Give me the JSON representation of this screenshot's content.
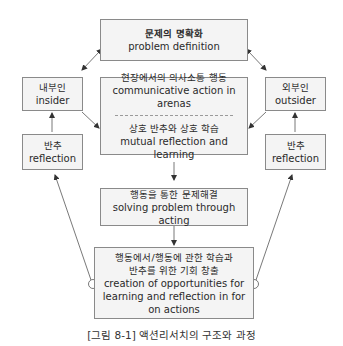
{
  "nodes": {
    "problem_definition": {
      "ko": "문제의 명확화",
      "en": "problem definition"
    },
    "insider": {
      "ko": "내부인",
      "en": "insider"
    },
    "outsider": {
      "ko": "외부인",
      "en": "outsider"
    },
    "communicative_action": {
      "ko": "현장에서의 의사소통 행동",
      "en": "communicative action in arenas"
    },
    "mutual_reflection": {
      "ko": "상호 반추와 상호 학습",
      "en": "mutual reflection and learning"
    },
    "reflection_left": {
      "ko": "반추",
      "en": "reflection"
    },
    "reflection_right": {
      "ko": "반추",
      "en": "reflection"
    },
    "solving_problem": {
      "ko": "행동을 통한 문제해결",
      "en": "solving problem through acting"
    },
    "creation_opportunities": {
      "ko_line1": "행동에서/행동에 관한 학습과",
      "ko_line2": "반추를 위한 기회 창출",
      "en_line1": "creation of opportunities for",
      "en_line2": "learning and reflection in for",
      "en_line3": "on actions"
    }
  },
  "edges": [
    {
      "from": "problem_definition",
      "to": "insider",
      "type": "bidirectional"
    },
    {
      "from": "problem_definition",
      "to": "outsider",
      "type": "bidirectional"
    },
    {
      "from": "insider",
      "to": "communicative_action",
      "type": "arrow"
    },
    {
      "from": "outsider",
      "to": "communicative_action",
      "type": "arrow"
    },
    {
      "from": "reflection_left",
      "to": "insider",
      "type": "arrow"
    },
    {
      "from": "reflection_right",
      "to": "outsider",
      "type": "arrow"
    },
    {
      "from": "communicative_action",
      "to": "solving_problem",
      "type": "arrow"
    },
    {
      "from": "solving_problem",
      "to": "creation_opportunities",
      "type": "arrow"
    },
    {
      "from": "creation_opportunities",
      "to": "reflection_left",
      "type": "arrow-circle-origin"
    },
    {
      "from": "creation_opportunities",
      "to": "reflection_right",
      "type": "arrow-circle-origin"
    }
  ],
  "caption": "[그림 8-1] 액션리서치의 구조와 과정",
  "colors": {
    "box_fill": "#f4f4f4",
    "box_border": "#8a8a8a",
    "line": "#555555"
  }
}
